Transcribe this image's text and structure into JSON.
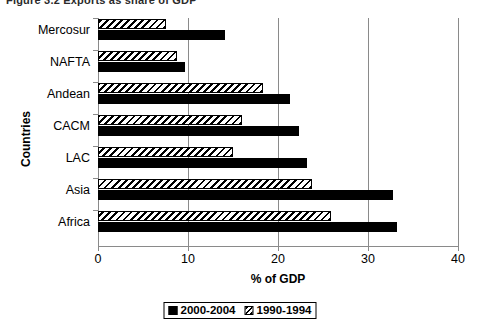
{
  "figure": {
    "caption": "Figure 3.2   Exports as share of GDP"
  },
  "chart_data": {
    "type": "bar",
    "orientation": "horizontal",
    "title": "",
    "xlabel": "% of GDP",
    "ylabel": "Countries",
    "xlim": [
      0,
      40
    ],
    "xticks": [
      0,
      10,
      20,
      30,
      40
    ],
    "grid": "vertical",
    "legend_position": "bottom",
    "categories": [
      "Mercosur",
      "NAFTA",
      "Andean",
      "CACM",
      "LAC",
      "Asia",
      "Africa"
    ],
    "series": [
      {
        "name": "2000-2004",
        "style": "solid-black",
        "values": [
          14.1,
          9.7,
          21.3,
          22.3,
          23.2,
          32.8,
          33.2
        ]
      },
      {
        "name": "1990-1994",
        "style": "diagonal-hatch",
        "values": [
          7.6,
          8.8,
          18.3,
          16.0,
          15.0,
          23.8,
          25.9
        ]
      }
    ]
  },
  "axes": {
    "x_tick_labels": [
      "0",
      "10",
      "20",
      "30",
      "40"
    ],
    "x_title": "% of GDP",
    "y_title": "Countries",
    "y_tick_labels": [
      "Mercosur",
      "NAFTA",
      "Andean",
      "CACM",
      "LAC",
      "Asia",
      "Africa"
    ]
  },
  "legend": {
    "items": [
      {
        "label": "2000-2004",
        "style": "solid"
      },
      {
        "label": "1990-1994",
        "style": "hatch"
      }
    ]
  }
}
